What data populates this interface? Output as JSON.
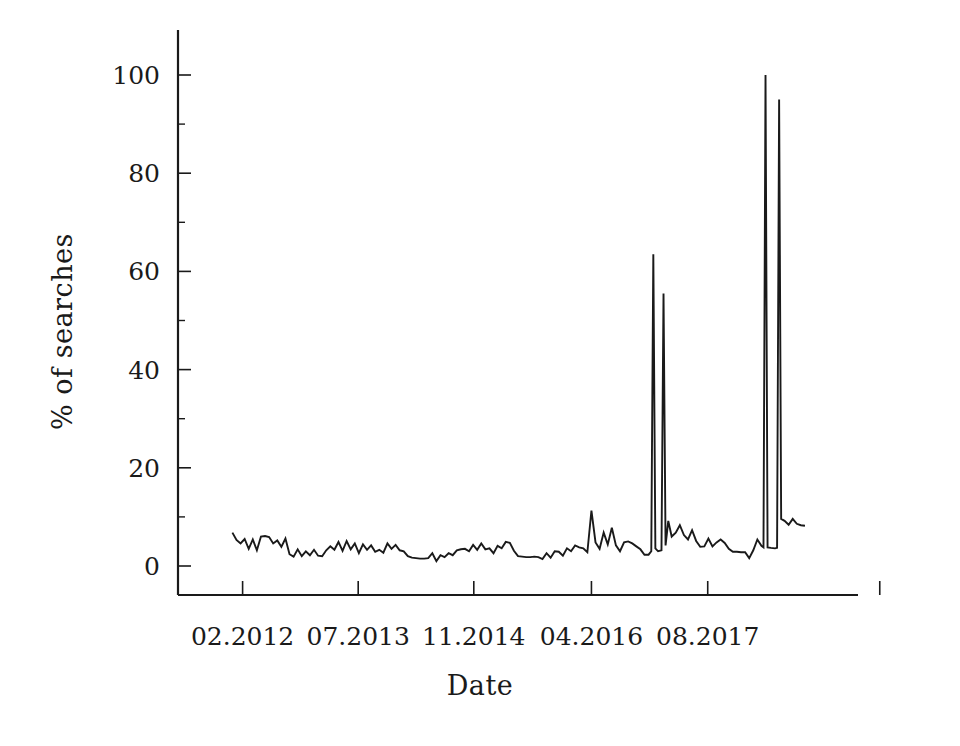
{
  "chart_data": {
    "type": "line",
    "title": "",
    "subtitle": "",
    "xlabel": "Date",
    "ylabel": "% of searches",
    "grid": false,
    "legend": false,
    "legend_position": "none",
    "line_color": "#1a1a1a",
    "background_color": "#ffffff",
    "ylim": [
      0,
      108
    ],
    "yticks": [
      0,
      20,
      40,
      60,
      80,
      100
    ],
    "ytick_labels": [
      "0",
      "20",
      "40",
      "60",
      "80",
      "100"
    ],
    "xlim": [
      0,
      100
    ],
    "xticks": [
      9.5,
      26.5,
      43.5,
      60.8,
      77.9,
      103.2
    ],
    "xtick_labels": [
      "02.2012",
      "07.2013",
      "11.2014",
      "04.2016",
      "08.2017"
    ],
    "xtick_label_positions": [
      9.5,
      26.5,
      43.5,
      60.8,
      77.9
    ],
    "annotations": [
      {
        "label": "spike-1",
        "x": 69.9,
        "y": 63.5
      },
      {
        "label": "spike-2",
        "x": 71.4,
        "y": 55.5
      },
      {
        "label": "spike-3",
        "x": 86.4,
        "y": 100.0
      },
      {
        "label": "spike-4",
        "x": 88.4,
        "y": 95.0
      }
    ],
    "x": [
      8.0,
      8.6,
      9.2,
      9.8,
      10.4,
      11.0,
      11.6,
      12.2,
      12.8,
      13.4,
      14.0,
      14.6,
      15.2,
      15.8,
      16.4,
      17.0,
      17.6,
      18.2,
      18.8,
      19.4,
      20.0,
      20.6,
      21.2,
      21.8,
      22.4,
      23.0,
      23.6,
      24.2,
      24.8,
      25.4,
      26.0,
      26.6,
      27.2,
      27.8,
      28.4,
      29.0,
      29.6,
      30.2,
      30.8,
      31.4,
      32.0,
      32.6,
      33.2,
      33.8,
      34.4,
      35.0,
      35.6,
      36.2,
      36.8,
      37.4,
      38.0,
      38.6,
      39.2,
      39.8,
      40.4,
      41.0,
      41.6,
      42.2,
      42.8,
      43.4,
      44.0,
      44.6,
      45.2,
      45.8,
      46.4,
      47.0,
      47.6,
      48.2,
      48.8,
      49.4,
      50.0,
      50.6,
      51.2,
      51.8,
      52.4,
      53.0,
      53.6,
      54.2,
      54.8,
      55.4,
      56.0,
      56.6,
      57.2,
      57.8,
      58.4,
      59.0,
      59.6,
      60.2,
      60.8,
      61.4,
      62.0,
      62.6,
      63.2,
      63.8,
      64.4,
      65.0,
      65.6,
      66.2,
      66.8,
      67.4,
      68.0,
      68.6,
      69.2,
      69.6,
      69.9,
      70.2,
      70.6,
      71.1,
      71.4,
      71.7,
      72.1,
      72.6,
      73.2,
      73.8,
      74.4,
      75.0,
      75.6,
      76.2,
      76.8,
      77.4,
      78.0,
      78.6,
      79.2,
      79.8,
      80.4,
      81.0,
      81.6,
      82.2,
      82.8,
      83.4,
      84.0,
      84.6,
      85.2,
      85.8,
      86.1,
      86.4,
      86.7,
      87.2,
      87.8,
      88.1,
      88.4,
      88.7,
      89.2,
      89.8,
      90.4,
      91.0,
      91.6,
      92.2
    ],
    "y": [
      6.8,
      5.3,
      4.6,
      5.5,
      3.5,
      5.4,
      3.2,
      6.0,
      6.1,
      5.9,
      4.6,
      5.2,
      3.9,
      5.6,
      2.4,
      1.9,
      3.4,
      2.0,
      3.0,
      2.2,
      3.3,
      2.1,
      2.0,
      3.2,
      4.0,
      3.3,
      4.9,
      3.1,
      5.1,
      3.4,
      4.6,
      2.6,
      4.4,
      3.3,
      4.2,
      2.9,
      3.3,
      2.7,
      4.6,
      3.5,
      4.3,
      3.2,
      3.0,
      2.0,
      1.7,
      1.6,
      1.5,
      1.5,
      1.6,
      2.6,
      1.0,
      2.2,
      1.8,
      2.6,
      2.2,
      3.2,
      3.4,
      3.5,
      3.0,
      4.3,
      3.3,
      4.6,
      3.4,
      3.6,
      2.6,
      4.1,
      3.6,
      4.9,
      4.7,
      3.1,
      2.0,
      1.9,
      1.8,
      1.8,
      1.9,
      1.8,
      1.4,
      2.6,
      1.7,
      3.0,
      2.9,
      2.1,
      3.6,
      3.0,
      4.2,
      3.8,
      3.6,
      2.8,
      11.3,
      4.8,
      3.5,
      6.8,
      4.4,
      7.8,
      4.2,
      3.0,
      4.8,
      5.0,
      4.6,
      4.0,
      3.4,
      2.3,
      2.3,
      3.0,
      63.5,
      3.6,
      3.0,
      3.2,
      55.5,
      4.2,
      9.2,
      6.0,
      6.8,
      8.3,
      6.3,
      5.4,
      7.3,
      5.1,
      3.9,
      4.0,
      5.6,
      4.0,
      4.8,
      5.4,
      4.7,
      3.5,
      2.9,
      2.9,
      2.8,
      2.8,
      1.6,
      3.2,
      5.4,
      4.1,
      3.8,
      100.0,
      3.8,
      3.7,
      3.6,
      3.7,
      95.0,
      9.6,
      9.2,
      8.4,
      9.6,
      8.6,
      8.3,
      8.2
    ]
  }
}
